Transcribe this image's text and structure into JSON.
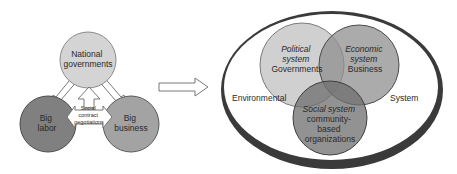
{
  "left_diagram": {
    "national": {
      "label_line1": "National",
      "label_line2": "governments",
      "color": "#d4d4d4"
    },
    "labor": {
      "label_line1": "Big",
      "label_line2": "labor",
      "color": "#808080"
    },
    "business": {
      "label_line1": "Big",
      "label_line2": "business",
      "color": "#a3a3a3"
    },
    "negotiation": {
      "line1": "Social",
      "line2": "contract",
      "line3": "negotiations"
    }
  },
  "transition_arrow": {
    "direction": "right"
  },
  "right_diagram": {
    "environment": {
      "left_label": "Environmental",
      "right_label": "System",
      "ring_color": "#3a3a3a"
    },
    "political": {
      "line1": "Political",
      "line2": "system",
      "line3": "Governments",
      "color": "#c8c8c8"
    },
    "economic": {
      "line1": "Economic",
      "line2": "system",
      "line3": "Business",
      "color": "#a5a5a5"
    },
    "social": {
      "line1": "Social system",
      "line2": "community-",
      "line3": "based",
      "line4": "organizations",
      "color": "#8a8a8a"
    }
  }
}
